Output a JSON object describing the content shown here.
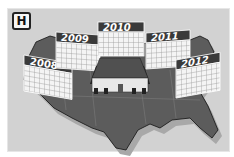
{
  "badge": {
    "letter": "H"
  },
  "illustration": {
    "subject": "map of the United States with a house in the center surrounded by calendar pages",
    "calendars": [
      {
        "year": "2008"
      },
      {
        "year": "2009"
      },
      {
        "year": "2010"
      },
      {
        "year": "2011"
      },
      {
        "year": "2012"
      }
    ],
    "colors": {
      "background": "#d2d2d2",
      "map": "#5a5a5a",
      "calendar_header": "#3a3a3a",
      "calendar_grid": "#f2f2f2"
    }
  }
}
